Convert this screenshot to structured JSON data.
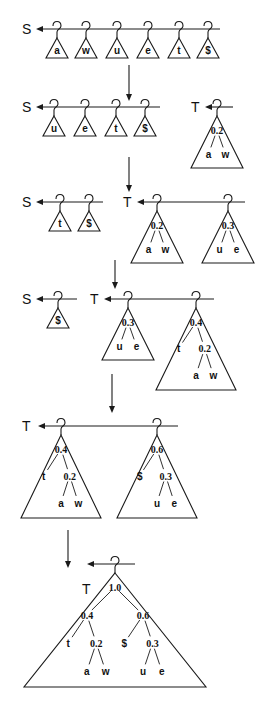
{
  "diagram": {
    "stages": [
      {
        "id": 1,
        "lists": [
          {
            "label": "S",
            "label_x": 22,
            "y": 29,
            "x1": 36,
            "x2": 220,
            "items": [
              {
                "type": "leaf",
                "x": 57,
                "symbol": "a"
              },
              {
                "type": "leaf",
                "x": 86,
                "symbol": "w"
              },
              {
                "type": "leaf",
                "x": 117,
                "symbol": "u"
              },
              {
                "type": "leaf",
                "x": 148,
                "symbol": "e"
              },
              {
                "type": "leaf",
                "x": 179,
                "symbol": "t"
              },
              {
                "type": "leaf",
                "x": 208,
                "symbol": "$"
              }
            ]
          }
        ]
      },
      {
        "id": 2,
        "lists": [
          {
            "label": "S",
            "label_x": 22,
            "y": 107,
            "x1": 36,
            "x2": 160,
            "items": [
              {
                "type": "leaf",
                "x": 54,
                "symbol": "u"
              },
              {
                "type": "leaf",
                "x": 85,
                "symbol": "e"
              },
              {
                "type": "leaf",
                "x": 116,
                "symbol": "t"
              },
              {
                "type": "leaf",
                "x": 145,
                "symbol": "$"
              }
            ]
          },
          {
            "label": "T",
            "label_x": 191,
            "y": 107,
            "x1": 205,
            "x2": 233,
            "items": [
              {
                "type": "tree",
                "x": 217,
                "height": 52,
                "halfwidth": 26,
                "tree": {
                  "w": "0.2",
                  "c": [
                    {
                      "s": "a"
                    },
                    {
                      "s": "w"
                    }
                  ]
                }
              }
            ]
          }
        ]
      },
      {
        "id": 3,
        "lists": [
          {
            "label": "S",
            "label_x": 22,
            "y": 202,
            "x1": 36,
            "x2": 103,
            "items": [
              {
                "type": "leaf",
                "x": 60,
                "symbol": "t"
              },
              {
                "type": "leaf",
                "x": 89,
                "symbol": "$"
              }
            ]
          },
          {
            "label": "T",
            "label_x": 123,
            "y": 202,
            "x1": 137,
            "x2": 245,
            "items": [
              {
                "type": "tree",
                "x": 157,
                "height": 52,
                "halfwidth": 26,
                "tree": {
                  "w": "0.2",
                  "c": [
                    {
                      "s": "a"
                    },
                    {
                      "s": "w"
                    }
                  ]
                }
              },
              {
                "type": "tree",
                "x": 228,
                "height": 52,
                "halfwidth": 26,
                "tree": {
                  "w": "0.3",
                  "c": [
                    {
                      "s": "u"
                    },
                    {
                      "s": "e"
                    }
                  ]
                }
              }
            ]
          }
        ]
      },
      {
        "id": 4,
        "lists": [
          {
            "label": "S",
            "label_x": 22,
            "y": 299,
            "x1": 36,
            "x2": 77,
            "items": [
              {
                "type": "leaf",
                "x": 58,
                "symbol": "$"
              }
            ]
          },
          {
            "label": "T",
            "label_x": 90,
            "y": 299,
            "x1": 104,
            "x2": 214,
            "items": [
              {
                "type": "tree",
                "x": 128,
                "height": 52,
                "halfwidth": 26,
                "tree": {
                  "w": "0.3",
                  "c": [
                    {
                      "s": "u"
                    },
                    {
                      "s": "e"
                    }
                  ]
                }
              },
              {
                "type": "tree",
                "x": 196,
                "height": 82,
                "halfwidth": 40,
                "tree": {
                  "w": "0.4",
                  "c": [
                    {
                      "s": "t"
                    },
                    {
                      "w": "0.2",
                      "c": [
                        {
                          "s": "a"
                        },
                        {
                          "s": "w"
                        }
                      ]
                    }
                  ]
                }
              }
            ]
          }
        ]
      },
      {
        "id": 5,
        "lists": [
          {
            "label": "T",
            "label_x": 22,
            "y": 426,
            "x1": 38,
            "x2": 178,
            "items": [
              {
                "type": "tree",
                "x": 61,
                "height": 83,
                "halfwidth": 40,
                "tree": {
                  "w": "0.4",
                  "c": [
                    {
                      "s": "t"
                    },
                    {
                      "w": "0.2",
                      "c": [
                        {
                          "s": "a"
                        },
                        {
                          "s": "w"
                        }
                      ]
                    }
                  ]
                }
              },
              {
                "type": "tree",
                "x": 157,
                "height": 83,
                "halfwidth": 40,
                "tree": {
                  "w": "0.6",
                  "c": [
                    {
                      "s": "$"
                    },
                    {
                      "w": "0.3",
                      "c": [
                        {
                          "s": "u"
                        },
                        {
                          "s": "e"
                        }
                      ]
                    }
                  ]
                }
              }
            ]
          }
        ]
      },
      {
        "id": 6,
        "lists": [
          {
            "label": "T",
            "label_x": 82,
            "label_y": 594,
            "y": 564,
            "x1": 87,
            "x2": 135,
            "items": [
              {
                "type": "tree",
                "x": 115,
                "height": 114,
                "halfwidth": 91,
                "tree": {
                  "w": "1.0",
                  "c": [
                    {
                      "w": "0.4",
                      "c": [
                        {
                          "s": "t"
                        },
                        {
                          "w": "0.2",
                          "c": [
                            {
                              "s": "a"
                            },
                            {
                              "s": "w"
                            }
                          ]
                        }
                      ]
                    },
                    {
                      "w": "0.6",
                      "c": [
                        {
                          "s": "$"
                        },
                        {
                          "w": "0.3",
                          "c": [
                            {
                              "s": "u"
                            },
                            {
                              "s": "e"
                            }
                          ]
                        }
                      ]
                    }
                  ]
                }
              }
            ]
          }
        ]
      }
    ],
    "arrows": [
      {
        "x": 129,
        "y1": 65,
        "y2": 101
      },
      {
        "x": 129,
        "y1": 157,
        "y2": 192
      },
      {
        "x": 115,
        "y1": 260,
        "y2": 289
      },
      {
        "x": 112,
        "y1": 374,
        "y2": 413
      },
      {
        "x": 68,
        "y1": 530,
        "y2": 568
      }
    ],
    "colors": {
      "ink": "#1a1a1a",
      "background": "#ffffff"
    }
  }
}
